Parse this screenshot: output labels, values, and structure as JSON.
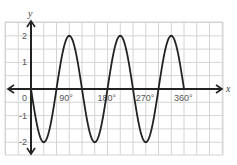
{
  "chart_data": {
    "type": "line",
    "title": "",
    "xlabel": "x",
    "ylabel": "y",
    "function": "y = -2 sin(3x)",
    "x_unit": "degrees",
    "xlim": [
      -60,
      450
    ],
    "ylim": [
      -2.5,
      2.5
    ],
    "x_ticks": [
      {
        "value": 0,
        "label": "0"
      },
      {
        "value": 90,
        "label": "90°"
      },
      {
        "value": 180,
        "label": "180°"
      },
      {
        "value": 270,
        "label": "270°"
      },
      {
        "value": 360,
        "label": "360°"
      }
    ],
    "y_ticks": [
      {
        "value": 2,
        "label": "2"
      },
      {
        "value": 1,
        "label": "1"
      },
      {
        "value": -1,
        "label": "-1"
      },
      {
        "value": -2,
        "label": "-2"
      }
    ],
    "grid": true,
    "legend": null,
    "series": [
      {
        "name": "curve",
        "x": [
          0,
          30,
          60,
          90,
          120,
          150,
          180,
          210,
          240,
          270,
          300,
          330,
          360
        ],
        "values": [
          0,
          -2,
          0,
          2,
          0,
          -2,
          0,
          2,
          0,
          -2,
          0,
          2,
          0
        ]
      }
    ],
    "colors": {
      "grid": "#d4d4d4",
      "axis": "#222222",
      "curve": "#222222",
      "background": "#ffffff"
    }
  }
}
